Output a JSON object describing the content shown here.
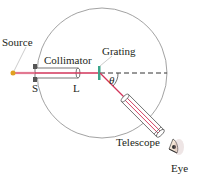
{
  "diagram": {
    "labels": {
      "source": "Source",
      "collimator": "Collimator",
      "grating": "Grating",
      "slit": "S",
      "lens": "L",
      "angle": "θ",
      "telescope": "Telescope",
      "eye": "Eye"
    },
    "colors": {
      "beam": "#d2345a",
      "circle": "#8a8a8a",
      "grating": "#3aa58a",
      "source": "#e0a020",
      "tube_fill": "#ffffff",
      "tube_stroke": "#555555",
      "text": "#231f20"
    }
  }
}
